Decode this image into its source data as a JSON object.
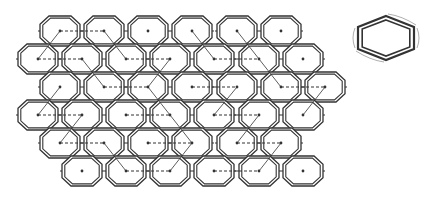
{
  "diagram": {
    "colors": {
      "stroke": "#333333",
      "background": "#ffffff"
    },
    "hex": {
      "half_width": 20,
      "half_height": 15,
      "inner_scale": 0.86
    },
    "rows": [
      {
        "y": 31,
        "x": [
          60,
          104,
          148,
          192,
          237,
          281
        ]
      },
      {
        "y": 59,
        "x": [
          38,
          82,
          126,
          170,
          214,
          259,
          303
        ]
      },
      {
        "y": 87,
        "x": [
          60,
          104,
          148,
          192,
          237,
          281,
          325
        ]
      },
      {
        "y": 115,
        "x": [
          38,
          82,
          126,
          170,
          214,
          259,
          303
        ]
      },
      {
        "y": 143,
        "x": [
          60,
          104,
          148,
          192,
          237,
          281
        ]
      },
      {
        "y": 171,
        "x": [
          82,
          126,
          170,
          214,
          259,
          303
        ]
      }
    ],
    "dashed_links": [
      [
        60,
        31,
        104,
        31
      ],
      [
        38,
        59,
        82,
        59
      ],
      [
        126,
        59,
        170,
        59
      ],
      [
        214,
        59,
        259,
        59
      ],
      [
        104,
        87,
        148,
        87
      ],
      [
        192,
        87,
        237,
        87
      ],
      [
        281,
        87,
        325,
        87
      ],
      [
        38,
        115,
        82,
        115
      ],
      [
        126,
        115,
        170,
        115
      ],
      [
        214,
        115,
        259,
        115
      ],
      [
        60,
        143,
        104,
        143
      ],
      [
        148,
        143,
        192,
        143
      ],
      [
        237,
        143,
        281,
        143
      ],
      [
        126,
        171,
        170,
        171
      ],
      [
        214,
        171,
        259,
        171
      ]
    ],
    "solid_links": [
      [
        60,
        31,
        38,
        59
      ],
      [
        104,
        31,
        126,
        59
      ],
      [
        192,
        31,
        214,
        59
      ],
      [
        237,
        31,
        259,
        59
      ],
      [
        82,
        59,
        104,
        87
      ],
      [
        170,
        59,
        148,
        87
      ],
      [
        259,
        59,
        281,
        87
      ],
      [
        60,
        87,
        38,
        115
      ],
      [
        148,
        87,
        170,
        115
      ],
      [
        237,
        87,
        214,
        115
      ],
      [
        325,
        87,
        303,
        115
      ],
      [
        82,
        115,
        60,
        143
      ],
      [
        170,
        115,
        192,
        143
      ],
      [
        259,
        115,
        237,
        143
      ],
      [
        104,
        143,
        126,
        171
      ],
      [
        192,
        143,
        170,
        171
      ],
      [
        281,
        143,
        259,
        171
      ]
    ],
    "inset": {
      "cx": 386,
      "cy": 38,
      "half_width": 28,
      "half_height": 22
    }
  }
}
